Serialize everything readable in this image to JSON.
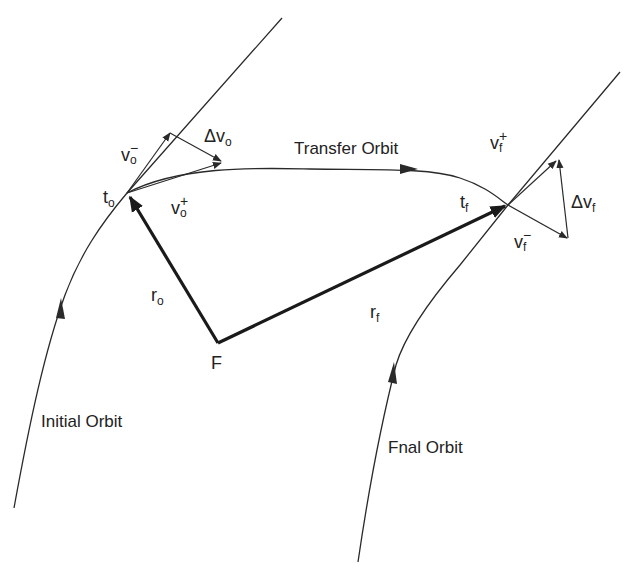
{
  "diagram": {
    "colors": {
      "line": "#2a2a2a",
      "background": "#ffffff"
    },
    "orbits": {
      "initial": {
        "label": "Initial Orbit"
      },
      "transfer": {
        "label": "Transfer Orbit"
      },
      "final": {
        "label": "Fnal Orbit"
      }
    },
    "points": {
      "focus": {
        "label": "F"
      },
      "t_o": {
        "base": "t",
        "sub": "o"
      },
      "t_f": {
        "base": "t",
        "sub": "f"
      }
    },
    "vectors": {
      "r_o": {
        "base": "r",
        "sub": "o"
      },
      "r_f": {
        "base": "r",
        "sub": "f"
      },
      "v_o_minus": {
        "base": "v",
        "sup": "−",
        "sub": "o"
      },
      "v_o_plus": {
        "base": "v",
        "sup": "+",
        "sub": "o"
      },
      "dv_o": {
        "base": "Δv",
        "sub": "o"
      },
      "v_f_plus": {
        "base": "v",
        "sup": "+",
        "sub": "f"
      },
      "v_f_minus": {
        "base": "v",
        "sup": "−",
        "sub": "f"
      },
      "dv_f": {
        "base": "Δv",
        "sub": "f"
      }
    }
  }
}
